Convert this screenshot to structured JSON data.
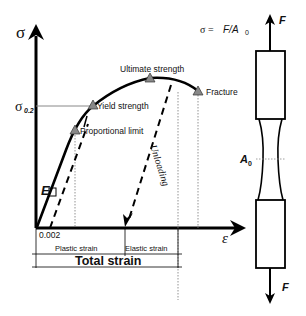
{
  "diagram": {
    "axes": {
      "y_label": "σ",
      "x_label": "ε",
      "sigma_02_label_main": "σ",
      "sigma_02_label_sub": "0.2",
      "strain_offset_label": "0.002"
    },
    "points": {
      "ultimate": "Ultimate strength",
      "fracture": "Fracture",
      "yield": "Yield strength",
      "proportional": "Proportional  limit",
      "modulus": "E"
    },
    "unloading_label": "Unloading",
    "strain_labels": {
      "plastic": "Plastic strain",
      "elastic": "Elastic strain",
      "total": "Total strain"
    },
    "specimen": {
      "formula_prefix": "σ =",
      "formula_body": "F/A",
      "formula_sub": "0",
      "force_top": "F",
      "force_bottom": "F",
      "area_main": "A",
      "area_sub": "0"
    }
  }
}
